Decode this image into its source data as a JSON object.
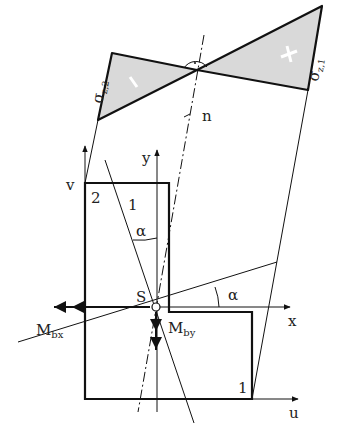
{
  "diagram": {
    "type": "stress distribution in L-shaped cross-section under oblique bending",
    "stress_diagram": {
      "label_left": "σz,2",
      "label_left_main": "σ",
      "label_left_sub": "z,2",
      "label_right": "σz,1",
      "label_right_main": "σ",
      "label_right_sub": "z,1",
      "sign_left": "−",
      "sign_right": "+",
      "fill_color": "#d9d9d9"
    },
    "axes": {
      "x": "x",
      "y": "y",
      "u": "u",
      "v": "v",
      "n": "n"
    },
    "points": {
      "centroid": "S",
      "corner_1": "1",
      "corner_2": "2"
    },
    "line_labels": {
      "line_1": "1"
    },
    "angles": {
      "alpha_upper": "α",
      "alpha_right": "α"
    },
    "moments": {
      "mbx_main": "M",
      "mbx_sub": "bx",
      "mby_main": "M",
      "mby_sub": "by"
    }
  }
}
